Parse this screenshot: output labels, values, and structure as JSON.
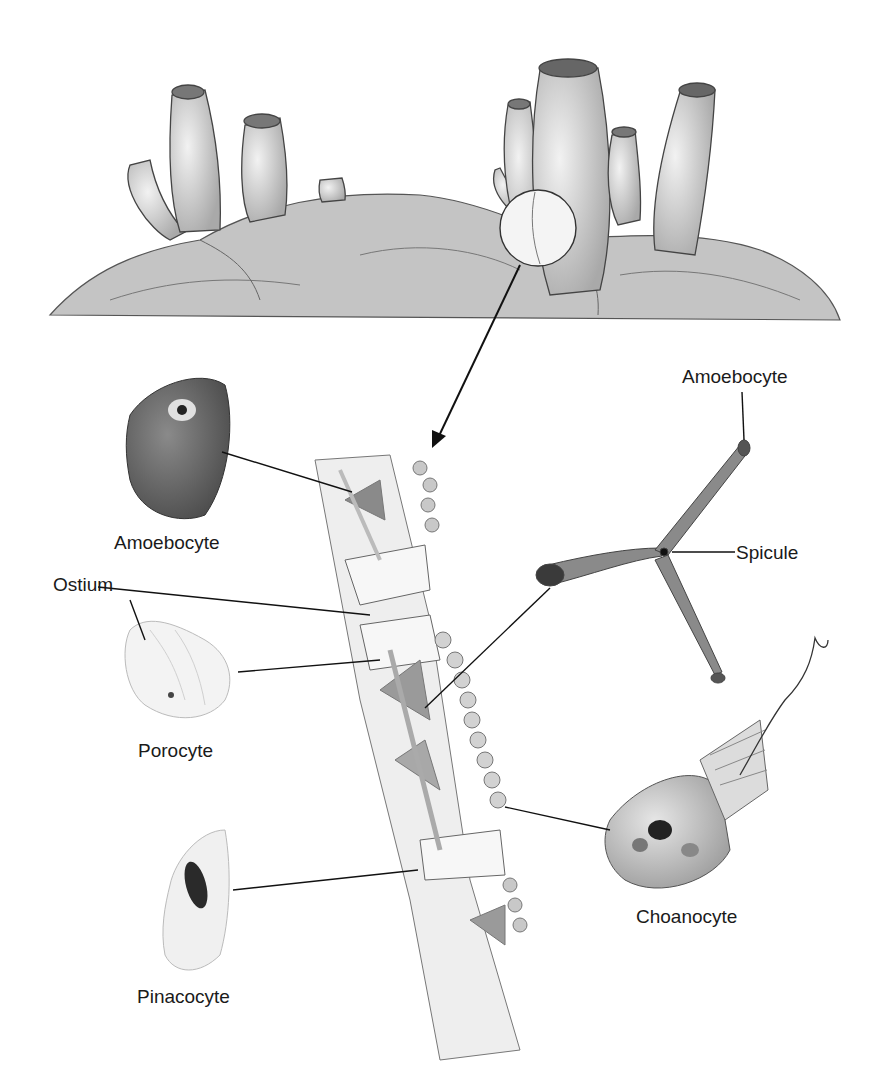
{
  "diagram": {
    "scene": "sponges-on-rock",
    "labels": {
      "amoebocyte_left": "Amoebocyte",
      "amoebocyte_right": "Amoebocyte",
      "spicule": "Spicule",
      "ostium": "Ostium",
      "porocyte": "Porocyte",
      "choanocyte": "Choanocyte",
      "pinacocyte": "Pinacocyte"
    },
    "colors": {
      "ink": "#1a1a1a",
      "tissue": "#e8e8e8",
      "cell_dark": "#6e6e6e",
      "rock": "#b8b8b8"
    }
  }
}
